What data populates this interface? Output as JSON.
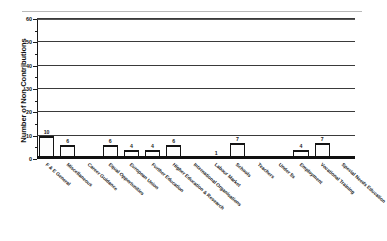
{
  "chart_data": {
    "type": "bar",
    "title": "",
    "xlabel": "",
    "ylabel": "Number of Non-Contributions",
    "ylim": [
      0,
      60
    ],
    "ytick_values": [
      0,
      10,
      20,
      30,
      40,
      50,
      60
    ],
    "ytick_labels": [
      "0",
      "10",
      "20",
      "30",
      "40",
      "50",
      "60"
    ],
    "y_minor_step": 5,
    "grid": "horizontal",
    "legend": "none",
    "bar_value_labels": true,
    "categories": [
      "F & E General",
      "Miscellaneous",
      "Career Guidance",
      "Equal Opportunities",
      "European Union",
      "Further Education",
      "Higher Education & Research",
      "International Organisations",
      "Labour Market",
      "Schools",
      "Teachers",
      "Under 5s",
      "Employment",
      "Vocational Training",
      "Special Needs Education"
    ],
    "values": [
      10,
      6,
      0,
      6,
      4,
      4,
      6,
      0,
      1,
      7,
      0,
      0,
      4,
      7,
      0
    ],
    "value_labels": [
      "10",
      "6",
      "",
      "6",
      "4",
      "4",
      "6",
      "",
      "1",
      "7",
      "",
      "",
      "4",
      "7",
      ""
    ],
    "colors": {
      "bar_fill": "#fdfdfd",
      "bar_edge": "#141414",
      "gridline": "#3a3a3a",
      "axis": "#1a1a1a",
      "baseline": "#101010",
      "background": "#ffffff",
      "text": "#1a1a1a"
    }
  }
}
